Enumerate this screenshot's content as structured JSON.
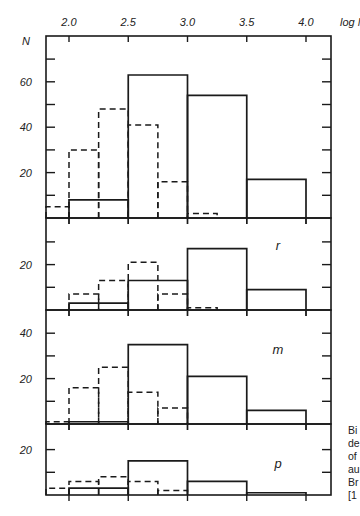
{
  "figure": {
    "x_axis_title": "log M",
    "y_axis_title": "N",
    "x_tick_labels": [
      "2.0",
      "2.5",
      "3.0",
      "3.5",
      "4.0"
    ],
    "caption_fragments": [
      "Bi",
      "de",
      "of",
      "au",
      "Br",
      "[1"
    ]
  },
  "chart_data": [
    {
      "type": "bar",
      "panel": "all",
      "panel_label": "",
      "title": "",
      "xlabel": "log M",
      "ylabel": "N",
      "xlim": [
        1.75,
        4.25
      ],
      "ylim": [
        0,
        80
      ],
      "y_ticks": [
        10,
        20,
        30,
        40,
        50,
        60,
        70
      ],
      "y_tick_labels": [
        "20",
        "40",
        "60"
      ],
      "grid": false,
      "series": [
        {
          "name": "solid",
          "style": "solid",
          "bins": [
            [
              2.0,
              2.5,
              8
            ],
            [
              2.5,
              3.0,
              63
            ],
            [
              3.0,
              3.5,
              54
            ],
            [
              3.5,
              4.0,
              17
            ]
          ]
        },
        {
          "name": "dashed",
          "style": "dashed",
          "bins": [
            [
              1.75,
              2.0,
              5
            ],
            [
              2.0,
              2.25,
              30
            ],
            [
              2.25,
              2.5,
              48
            ],
            [
              2.5,
              2.75,
              41
            ],
            [
              2.75,
              3.0,
              16
            ],
            [
              3.0,
              3.25,
              2
            ]
          ]
        }
      ]
    },
    {
      "type": "bar",
      "panel": "r",
      "panel_label": "r",
      "xlim": [
        1.75,
        4.25
      ],
      "ylim": [
        0,
        40
      ],
      "y_ticks": [
        10,
        20,
        30
      ],
      "y_tick_labels": [
        "20"
      ],
      "grid": false,
      "series": [
        {
          "name": "solid",
          "style": "solid",
          "bins": [
            [
              2.0,
              2.5,
              3
            ],
            [
              2.5,
              3.0,
              13
            ],
            [
              3.0,
              3.5,
              27
            ],
            [
              3.5,
              4.0,
              9
            ]
          ]
        },
        {
          "name": "dashed",
          "style": "dashed",
          "bins": [
            [
              2.0,
              2.25,
              7
            ],
            [
              2.25,
              2.5,
              13
            ],
            [
              2.5,
              2.75,
              21
            ],
            [
              2.75,
              3.0,
              7
            ],
            [
              3.0,
              3.25,
              1
            ]
          ]
        }
      ]
    },
    {
      "type": "bar",
      "panel": "m",
      "panel_label": "m",
      "xlim": [
        1.75,
        4.25
      ],
      "ylim": [
        0,
        50
      ],
      "y_ticks": [
        10,
        20,
        30,
        40
      ],
      "y_tick_labels": [
        "20",
        "40"
      ],
      "grid": false,
      "series": [
        {
          "name": "solid",
          "style": "solid",
          "bins": [
            [
              2.0,
              2.5,
              1
            ],
            [
              2.5,
              3.0,
              35
            ],
            [
              3.0,
              3.5,
              21
            ],
            [
              3.5,
              4.0,
              6
            ]
          ]
        },
        {
          "name": "dashed",
          "style": "dashed",
          "bins": [
            [
              1.75,
              2.0,
              1
            ],
            [
              2.0,
              2.25,
              16
            ],
            [
              2.25,
              2.5,
              25
            ],
            [
              2.5,
              2.75,
              14
            ],
            [
              2.75,
              3.0,
              7
            ]
          ]
        }
      ]
    },
    {
      "type": "bar",
      "panel": "p",
      "panel_label": "p",
      "xlim": [
        1.75,
        4.25
      ],
      "ylim": [
        0,
        30
      ],
      "y_ticks": [
        10,
        20
      ],
      "y_tick_labels": [
        "20"
      ],
      "grid": false,
      "series": [
        {
          "name": "solid",
          "style": "solid",
          "bins": [
            [
              2.0,
              2.5,
              3
            ],
            [
              2.5,
              3.0,
              15
            ],
            [
              3.0,
              3.5,
              6
            ],
            [
              3.5,
              4.0,
              1
            ]
          ]
        },
        {
          "name": "dashed",
          "style": "dashed",
          "bins": [
            [
              1.75,
              2.0,
              3
            ],
            [
              2.0,
              2.25,
              6
            ],
            [
              2.25,
              2.5,
              8
            ],
            [
              2.5,
              2.75,
              6
            ],
            [
              2.75,
              3.0,
              2
            ]
          ]
        }
      ]
    }
  ]
}
